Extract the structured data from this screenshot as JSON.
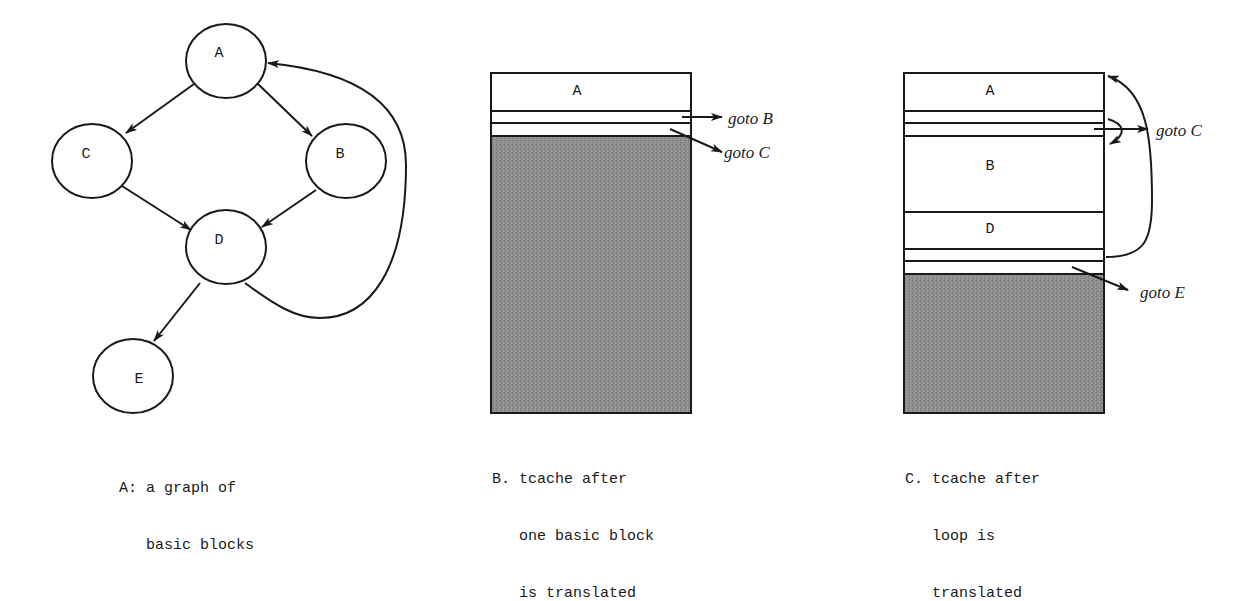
{
  "panel_a": {
    "caption_line1": "A: a graph of",
    "caption_line2": "   basic blocks",
    "nodes": [
      {
        "id": "A",
        "label": "A"
      },
      {
        "id": "C",
        "label": "C"
      },
      {
        "id": "B",
        "label": "B"
      },
      {
        "id": "D",
        "label": "D"
      },
      {
        "id": "E",
        "label": "E"
      }
    ],
    "edges": [
      {
        "from": "A",
        "to": "C"
      },
      {
        "from": "A",
        "to": "B"
      },
      {
        "from": "C",
        "to": "D"
      },
      {
        "from": "B",
        "to": "D"
      },
      {
        "from": "D",
        "to": "E"
      },
      {
        "from": "D",
        "to": "A",
        "style": "curved-loop"
      }
    ]
  },
  "panel_b": {
    "caption_line1": "B. tcache after",
    "caption_line2": "   one basic block",
    "caption_line3": "   is translated",
    "blocks": [
      {
        "label": "A"
      }
    ],
    "exits": [
      {
        "label": "goto B"
      },
      {
        "label": "goto C"
      }
    ]
  },
  "panel_c": {
    "caption_line1": "C. tcache after",
    "caption_line2": "   loop is",
    "caption_line3": "   translated",
    "blocks": [
      {
        "label": "A"
      },
      {
        "label": "B"
      },
      {
        "label": "D"
      }
    ],
    "exits": [
      {
        "label": "goto C"
      },
      {
        "label": "goto E"
      }
    ]
  },
  "colors": {
    "ink": "#1a1a1a",
    "free_space_fill": "#8c8c8c",
    "background": "#ffffff"
  }
}
